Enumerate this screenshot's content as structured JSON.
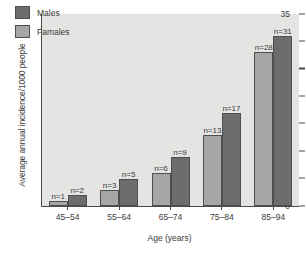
{
  "chart_data": {
    "type": "bar",
    "title": "",
    "xlabel": "Age (years)",
    "ylabel": "Average annual incidence/1000 people",
    "categories": [
      "45–54",
      "55–64",
      "65–74",
      "75–84",
      "85–94"
    ],
    "series": [
      {
        "name": "Famales",
        "color": "#a6a6a6",
        "values": [
          1,
          3,
          6,
          13,
          28
        ],
        "point_labels": [
          "n=1",
          "n=3",
          "n=6",
          "n=13",
          "n=28"
        ]
      },
      {
        "name": "Males",
        "color": "#6d6d6d",
        "values": [
          2,
          5,
          9,
          17,
          31
        ],
        "point_labels": [
          "n=2",
          "n=5",
          "n=9",
          "n=17",
          "n=31"
        ]
      }
    ],
    "ylim": [
      0,
      35
    ],
    "yticks": [
      0,
      5,
      10,
      15,
      20,
      25,
      30,
      35
    ],
    "ytick_labels": [
      "0",
      "5",
      "10",
      "15",
      "20",
      "25",
      "30",
      "35"
    ],
    "grid": false,
    "legend_position": "top-left",
    "legend_order": [
      "Males",
      "Famales"
    ],
    "plot_background": "#e4e4e2",
    "axis_color": "#4a4a4a"
  },
  "legend": {
    "entries": [
      {
        "label": "Males",
        "key": "males"
      },
      {
        "label": "Famales",
        "key": "females"
      }
    ]
  }
}
